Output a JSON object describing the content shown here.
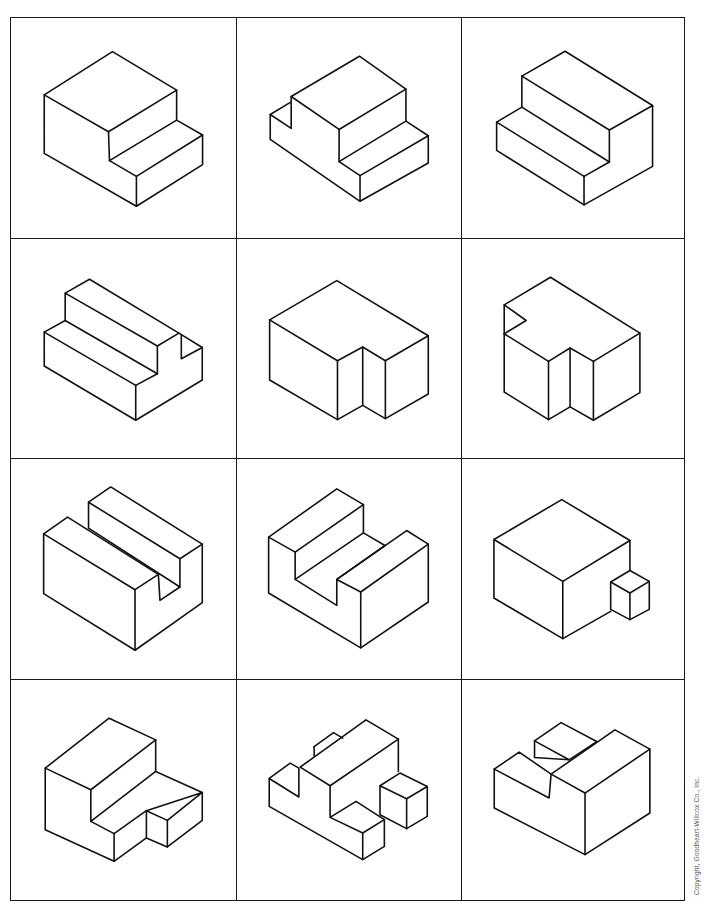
{
  "worksheet": {
    "grid": {
      "rows": 4,
      "cols": 3
    },
    "col_edges": [
      0,
      226,
      451,
      673
    ],
    "row_edges": [
      0,
      221,
      441,
      662,
      882
    ],
    "line_color": "#111111",
    "figures": [
      {
        "id": "fig-1",
        "label": "two-step block",
        "paths": [
          "M33.3,77 L101.7,33.7 L166,72.3 L97.7,114 Z",
          "M33.3,77 L33.3,135.7 L125.7,188.7 L192,147 L192,117.3 L166,102.3 L166,72.3",
          "M97.7,114 L98.7,143 L166,102.3",
          "M98.7,143 L125.7,158.7 L192,117.3",
          "M125.7,158.7 L125.7,188.7"
        ]
      },
      {
        "id": "fig-2",
        "label": "step block with notch",
        "paths": [
          "M54.3,78.7 L122.7,38.3 L169.3,71.3 L102.3,111.7 Z",
          "M54.3,78.7 L54.3,110.7 L33.3,96.7 L54.3,84",
          "M33.3,96.7 L33.3,121.7 L123.3,183.7 L191.7,145.3 L191.7,118 L169.3,103.3 L169.3,71.3",
          "M102.3,111.7 L102.3,144 L169.3,103.3",
          "M102.3,144 L123.3,158 L191.7,118",
          "M123.3,158 L123.3,183.7"
        ]
      },
      {
        "id": "fig-3",
        "label": "reverse step block",
        "paths": [
          "M60,58.3 L103.3,33.3 L191,87.7 L147.7,112.3 Z",
          "M147.7,112.3 L147.7,144.3",
          "M60,58.3 L60,89.3 L147.7,144.3",
          "M60,89.3 L34.7,104.3 L122.3,158.7 L147.7,144.3",
          "M34.7,104.3 L34.7,132.7 L122.3,187.3 L191,148.7 L191,87.7",
          "M122.3,158.7 L122.3,187.3"
        ]
      },
      {
        "id": "fig-4",
        "label": "step block with end notch",
        "paths": [
          "M54.3,54.3 L78.7,40.3 L168.3,94.3 L146.7,107.3 Z",
          "M146.7,107.3 L146.7,135",
          "M54.3,54.3 L54.3,81.7 L146.7,135",
          "M54.3,81.7 L33.3,93.3 L125,146.7 L146.7,135",
          "M168.3,94.3 L191.7,108.7 L191.7,141.3 L125,181.7 L33.3,127.3 L33.3,93.3",
          "M170.7,96.7 L170.7,120 L191.7,108.7",
          "M125,146.7 L125,181.7"
        ]
      },
      {
        "id": "fig-5",
        "label": "block with vertical slot",
        "paths": [
          "M32.7,81 L100,41.7 L191.7,97 L148.7,122 L126,108.3 L100.7,122 Z",
          "M32.7,81 L32.7,141.3 L100.7,181 L126,166.7 L148.7,180 L191.7,155.3 L191.7,97",
          "M100.7,122 L100.7,181",
          "M126,108.3 L126,166.7",
          "M148.7,122 L148.7,180"
        ]
      },
      {
        "id": "fig-6",
        "label": "block with slot and corner notch",
        "paths": [
          "M42.3,66 L88.7,38.3 L178.3,94.3 L131.7,122.7 L108.3,109.3 L86.7,122.7 L42.3,95 L64.3,81.7 Z",
          "M42.3,66 L42.3,95",
          "M42.3,95 L42.3,153.3 L86.7,181 L108.3,168.3 L131.7,181.7 L178.3,154 L178.3,94.3",
          "M86.7,122.7 L86.7,181",
          "M108.3,109.3 L108.3,168.3",
          "M131.7,122.7 L131.7,181.7"
        ]
      },
      {
        "id": "fig-7",
        "label": "block with deep groove",
        "paths": [
          "M77.7,43.3 L100,28 L191.7,85.3 L169.3,100 Z",
          "M77.7,43.3 L77.7,69.3 L169.3,128.3 L169.3,100",
          "M32.7,75 L56.7,58.3 L147.7,115.7 L124.3,131 Z",
          "M147.7,115.7 L149.3,141.7 L169.3,128.3",
          "M32.7,75 L32.7,135 L124.3,191.7 L191.7,144 L191.7,85.3",
          "M124.3,131 L124.3,191.7"
        ]
      },
      {
        "id": "fig-8",
        "label": "U-channel block",
        "paths": [
          "M31.7,78.3 L100,30 L126.7,45.7 L58.3,93.3 Z",
          "M126.7,45.7 L126.7,74 L58.3,120.7 L58.3,93.3",
          "M126.7,74 L148.3,86.7 L100,120.7",
          "M58.3,120.7 L100,146.7 L100,120.7 L170,71.7 L191.7,85.3 L124,133.3 L100,120.7",
          "M31.7,78.3 L31.7,134.3 L124,189.3 L191.7,143.3 L191.7,85.3",
          "M124,133.3 L124,189.3"
        ]
      },
      {
        "id": "fig-9",
        "label": "cube with small cube",
        "paths": [
          "M32,80.7 L100,40.7 L168.3,81.7 L101,122.7 Z",
          "M32,80.7 L32,139.3 L101,180 L149,152.7",
          "M101,122.7 L101,180",
          "M168.3,81.7 L168.3,111.7",
          "M149,123.3 L168.3,111.7 L187.7,122.7 L168.3,134.3 Z",
          "M149,123.3 L149,150.7 L168.3,161 L187.7,150.7 L187.7,122.7",
          "M168.3,134.3 L168.3,161"
        ]
      },
      {
        "id": "fig-10",
        "label": "L-block with cutout",
        "paths": [
          "M34.3,88.3 L98.3,38.3 L145,60 L80,110 Z",
          "M145,60 L145,91.7 L191.7,112.7 L135.7,131 L156.7,140.7 L191.7,112.7",
          "M80,110 L80,141.7 L145,91.7",
          "M80,141.7 L103.3,154 L135.7,131",
          "M135.7,131 L135.7,158.3 L156.7,167.3 L191.7,140.7 L191.7,112.7",
          "M156.7,140.7 L156.7,167.3",
          "M34.3,88.3 L34.3,150 L103.3,181.7 L135.7,158.3",
          "M103.3,154 L103.3,181.7"
        ]
      },
      {
        "id": "fig-11",
        "label": "complex stepped block",
        "paths": [
          "M63.3,87.3 L129.3,40 L161.7,59.3 L93.3,106 Z",
          "M77.3,66.7 L96.7,52.7 L106,58.3",
          "M77.3,66.7 L77.3,76",
          "M32.3,98.7 L53.3,83.3 L62,88.3 L62,117.3 L32.3,98.7",
          "M32.3,98.7 L32.3,126.7 L126,180 L147.7,166.7 L147.7,140",
          "M93.3,106 L93.3,137.7 L126,153.3 L147.7,140 L119.3,121.7 L93.3,137.7",
          "M126,153.3 L126,180",
          "M161.7,59.3 L161.7,91.7",
          "M143.3,106 L163.3,93.3 L190.7,106.7 L170,119 Z",
          "M143.3,106 L143.3,135 L170,149 L190.7,136.7 L190.7,106.7",
          "M170,119 L170,149"
        ]
      },
      {
        "id": "fig-12",
        "label": "block with raised tabs",
        "paths": [
          "M72.7,61 L99.3,42.7 L135,61.7",
          "M72.7,61 L72.7,77.7 L107.3,80",
          "M72.7,61 L107.3,80 L135,61.7",
          "M89.3,94.3 L153.3,50 L188.3,69.3 L123.3,113.3 Z",
          "M32.3,89.3 L57.3,72.3 L89.3,94.3 L87.3,118.3 L32.3,89.3",
          "M32.3,89.3 L32.3,128.3 L123.3,175 L188.3,133.3 L188.3,69.3",
          "M123.3,113.3 L123.3,175"
        ]
      }
    ]
  },
  "footer": {
    "copyright": "Copyright, Goodheart-Willcox Co., Inc."
  }
}
